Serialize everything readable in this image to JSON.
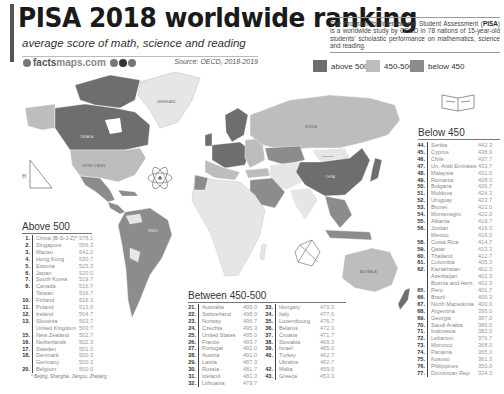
{
  "header": {
    "title": "PISA 2018 worldwide ranking",
    "subtitle": "average score of math, science and reading",
    "brand_bold": "facts",
    "brand_light": "maps.com",
    "source": "Source: OECD, 2018-2019"
  },
  "about": {
    "acronym": "PISA",
    "text_before": "The Program for International Student Assessment (",
    "text_after": ") is a worldwide study by OECD in 78 nations of 15-year-old students' scholastic performance on mathematics, science and reading."
  },
  "legend": [
    {
      "label": "above 500",
      "color": "#6e6e6e"
    },
    {
      "label": "450-500",
      "color": "#bdbdbd"
    },
    {
      "label": "below 450",
      "color": "#8c8c8c"
    }
  ],
  "colors": {
    "above": "#6e6e6e",
    "mid": "#bdbdbd",
    "below": "#8c8c8c",
    "ocean": "#ffffff",
    "nodata": "#e6e6e6"
  },
  "map_labels": {
    "greenland": "GREENLAND",
    "canada": "CANADA",
    "usa": "UNITED STATES",
    "brazil": "BRAZIL",
    "russia": "RUSSIA",
    "china": "CHINA",
    "mongolia": "MONGOLIA",
    "australia": "AUSTRALIA",
    "nz": "NEW ZEALAND"
  },
  "tables": {
    "above500": {
      "title": "Above 500",
      "rows": [
        {
          "rank": "1.",
          "country": "China (B-S-J-Z)*",
          "score": "578.1"
        },
        {
          "rank": "2.",
          "country": "Singapore",
          "score": "556.3"
        },
        {
          "rank": "3.",
          "country": "Macau",
          "score": "542.2"
        },
        {
          "rank": "4.",
          "country": "Hong Kong",
          "score": "530.7"
        },
        {
          "rank": "5.",
          "country": "Estonia",
          "score": "525.3"
        },
        {
          "rank": "6.",
          "country": "Japan",
          "score": "520.0"
        },
        {
          "rank": "7.",
          "country": "South Korea",
          "score": "519.7"
        },
        {
          "rank": "8.",
          "country": "Canada",
          "score": "516.7"
        },
        {
          "rank": "",
          "country": "Taiwan",
          "score": "516.7"
        },
        {
          "rank": "10.",
          "country": "Finland",
          "score": "516.3"
        },
        {
          "rank": "11.",
          "country": "Poland",
          "score": "513.0"
        },
        {
          "rank": "12.",
          "country": "Ireland",
          "score": "504.7"
        },
        {
          "rank": "13.",
          "country": "Slovenia",
          "score": "503.7"
        },
        {
          "rank": "",
          "country": "United Kingdom",
          "score": "503.7"
        },
        {
          "rank": "15.",
          "country": "New Zealand",
          "score": "502.7"
        },
        {
          "rank": "16.",
          "country": "Netherlands",
          "score": "502.3"
        },
        {
          "rank": "17.",
          "country": "Sweden",
          "score": "501.0"
        },
        {
          "rank": "18.",
          "country": "Denmark",
          "score": "500.3"
        },
        {
          "rank": "",
          "country": "Germany",
          "score": "500.3"
        },
        {
          "rank": "20.",
          "country": "Belgium",
          "score": "500.0"
        }
      ],
      "footnote": "* Beijing, Shanghai, Jiangsu, Zhejiang"
    },
    "between": {
      "title": "Between 450-500",
      "col1": [
        {
          "rank": "21.",
          "country": "Australia",
          "score": "499.0"
        },
        {
          "rank": "22.",
          "country": "Switzerland",
          "score": "498.0"
        },
        {
          "rank": "23.",
          "country": "Norway",
          "score": "496.7"
        },
        {
          "rank": "24.",
          "country": "Czechia",
          "score": "495.3"
        },
        {
          "rank": "25.",
          "country": "United States",
          "score": "495.0"
        },
        {
          "rank": "26.",
          "country": "France",
          "score": "493.7"
        },
        {
          "rank": "27.",
          "country": "Portugal",
          "score": "492.0"
        },
        {
          "rank": "28.",
          "country": "Austria",
          "score": "491.0"
        },
        {
          "rank": "29.",
          "country": "Latvia",
          "score": "487.3"
        },
        {
          "rank": "30.",
          "country": "Russia",
          "score": "481.7"
        },
        {
          "rank": "31.",
          "country": "Iceland",
          "score": "481.3"
        },
        {
          "rank": "32.",
          "country": "Lithuania",
          "score": "479.7"
        }
      ],
      "col2": [
        {
          "rank": "33.",
          "country": "Hungary",
          "score": "479.3"
        },
        {
          "rank": "34.",
          "country": "Italy",
          "score": "477.0"
        },
        {
          "rank": "35.",
          "country": "Luxembourg",
          "score": "476.7"
        },
        {
          "rank": "36.",
          "country": "Belarus",
          "score": "472.3"
        },
        {
          "rank": "37.",
          "country": "Croatia",
          "score": "471.7"
        },
        {
          "rank": "38.",
          "country": "Slovakia",
          "score": "469.3"
        },
        {
          "rank": "39.",
          "country": "Israel",
          "score": "465.0"
        },
        {
          "rank": "40.",
          "country": "Turkey",
          "score": "462.7"
        },
        {
          "rank": "",
          "country": "Ukraine",
          "score": "462.7"
        },
        {
          "rank": "42.",
          "country": "Malta",
          "score": "459.0"
        },
        {
          "rank": "43.",
          "country": "Greece",
          "score": "453.3"
        }
      ]
    },
    "below450": {
      "title": "Below 450",
      "rows": [
        {
          "rank": "44.",
          "country": "Serbia",
          "score": "442.3"
        },
        {
          "rank": "45.",
          "country": "Cyprus",
          "score": "438.0"
        },
        {
          "rank": "46.",
          "country": "Chile",
          "score": "437.7"
        },
        {
          "rank": "47.",
          "country": "Un. Arab Emirates",
          "score": "433.7"
        },
        {
          "rank": "48.",
          "country": "Malaysia",
          "score": "431.0"
        },
        {
          "rank": "49.",
          "country": "Romania",
          "score": "428.0"
        },
        {
          "rank": "50.",
          "country": "Bulgaria",
          "score": "426.7"
        },
        {
          "rank": "51.",
          "country": "Moldova",
          "score": "424.3"
        },
        {
          "rank": "52.",
          "country": "Uruguay",
          "score": "423.7"
        },
        {
          "rank": "53.",
          "country": "Brunei",
          "score": "423.0"
        },
        {
          "rank": "54.",
          "country": "Montenegro",
          "score": "422.0"
        },
        {
          "rank": "55.",
          "country": "Albania",
          "score": "419.7"
        },
        {
          "rank": "56.",
          "country": "Jordan",
          "score": "416.0"
        },
        {
          "rank": "",
          "country": "Mexico",
          "score": "416.0"
        },
        {
          "rank": "58.",
          "country": "Costa Rica",
          "score": "414.7"
        },
        {
          "rank": "59.",
          "country": "Qatar",
          "score": "413.3"
        },
        {
          "rank": "60.",
          "country": "Thailand",
          "score": "412.7"
        },
        {
          "rank": "61.",
          "country": "Colombia",
          "score": "405.3"
        },
        {
          "rank": "62.",
          "country": "Kazakhstan",
          "score": "402.3"
        },
        {
          "rank": "",
          "country": "Azerbaijan",
          "score": "402.3"
        },
        {
          "rank": "",
          "country": "Bosnia and Herz.",
          "score": "402.3"
        },
        {
          "rank": "65.",
          "country": "Peru",
          "score": "401.7"
        },
        {
          "rank": "66.",
          "country": "Brazil",
          "score": "400.3"
        },
        {
          "rank": "67.",
          "country": "North Macedonia",
          "score": "400.0"
        },
        {
          "rank": "68.",
          "country": "Argentina",
          "score": "395.0"
        },
        {
          "rank": "69.",
          "country": "Georgia",
          "score": "387.0"
        },
        {
          "rank": "70.",
          "country": "Saudi Arabia",
          "score": "386.0"
        },
        {
          "rank": "71.",
          "country": "Indonesia",
          "score": "382.0"
        },
        {
          "rank": "72.",
          "country": "Lebanon",
          "score": "376.7"
        },
        {
          "rank": "73.",
          "country": "Morocco",
          "score": "368.0"
        },
        {
          "rank": "74.",
          "country": "Panama",
          "score": "365.0"
        },
        {
          "rank": "75.",
          "country": "Kosovo",
          "score": "361.3"
        },
        {
          "rank": "76.",
          "country": "Philippines",
          "score": "350.0"
        },
        {
          "rank": "77.",
          "country": "Dominican Rep.",
          "score": "334.3"
        }
      ]
    }
  },
  "icons": [
    "triangle-math-icon",
    "atom-icon",
    "open-book-icon",
    "compass-geometry-icon",
    "book-stack-icon"
  ]
}
